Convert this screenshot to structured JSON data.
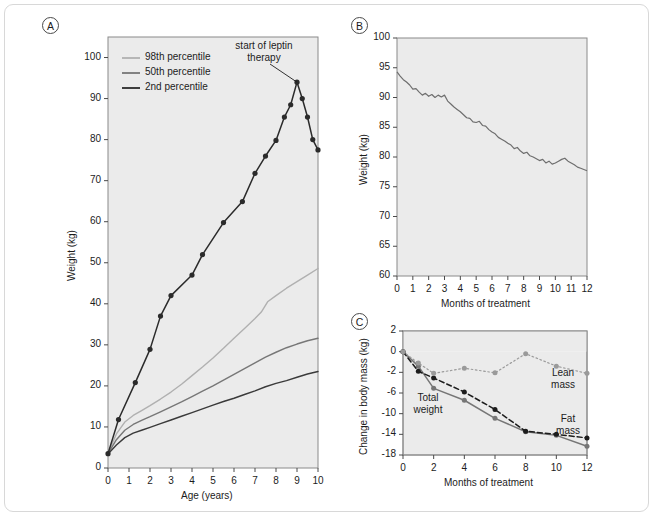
{
  "figure": {
    "panels": [
      "A",
      "B",
      "C"
    ]
  },
  "panelA": {
    "letter": "A",
    "xlabel": "Age (years)",
    "ylabel": "Weight (kg)",
    "yticks": [
      0,
      10,
      20,
      30,
      40,
      50,
      60,
      70,
      80,
      90,
      100
    ],
    "xticks": [
      0,
      1,
      2,
      3,
      4,
      5,
      6,
      7,
      8,
      9,
      10
    ],
    "legend": [
      {
        "label": "98th percentile",
        "color": "#b0b0b0"
      },
      {
        "label": "50th percentile",
        "color": "#777777"
      },
      {
        "label": "2nd percentile",
        "color": "#2b2b2b"
      }
    ],
    "annotation": {
      "line1": "start of leptin",
      "line2": "therapy"
    }
  },
  "panelB": {
    "letter": "B",
    "xlabel": "Months of treatment",
    "ylabel": "Weight (kg)",
    "yticks": [
      60,
      65,
      70,
      75,
      80,
      85,
      90,
      95,
      100
    ],
    "xticks": [
      0,
      1,
      2,
      3,
      4,
      5,
      6,
      7,
      8,
      9,
      10,
      11,
      12
    ]
  },
  "panelC": {
    "letter": "C",
    "xlabel": "Months of treatment",
    "ylabel": "Change in body mass (kg)",
    "yticks": [
      2,
      0,
      -2,
      -6,
      -10,
      -14,
      -18
    ],
    "xticks": [
      0,
      2,
      4,
      6,
      8,
      10,
      12
    ],
    "labels": {
      "total": {
        "line1": "Total",
        "line2": "weight"
      },
      "lean": {
        "line1": "Lean",
        "line2": "mass"
      },
      "fat": {
        "line1": "Fat",
        "line2": "mass"
      }
    }
  },
  "chart_data": [
    {
      "type": "line",
      "panel": "A",
      "title": "",
      "xlabel": "Age (years)",
      "ylabel": "Weight (kg)",
      "xlim": [
        0,
        10
      ],
      "ylim": [
        0,
        105
      ],
      "grid": false,
      "legend_position": "top-left",
      "annotations": [
        {
          "text": "start of leptin therapy",
          "x": 9.0,
          "y": 94.0
        }
      ],
      "series": [
        {
          "name": "patient",
          "color": "#2b2b2b",
          "markers": true,
          "x": [
            0,
            0.5,
            1.3,
            2.0,
            2.5,
            3.0,
            4.0,
            4.5,
            5.5,
            6.4,
            7.0,
            7.5,
            8.0,
            8.4,
            8.7,
            9.0,
            9.25,
            9.5,
            9.75,
            10.0
          ],
          "y": [
            3.5,
            11.8,
            20.8,
            28.9,
            37.0,
            42.0,
            47.0,
            52.0,
            59.8,
            64.9,
            71.8,
            76.0,
            79.8,
            85.5,
            88.5,
            94.0,
            90.0,
            85.5,
            80.0,
            77.5
          ]
        },
        {
          "name": "98th percentile",
          "color": "#b0b0b0",
          "markers": false,
          "x": [
            0,
            0.4,
            0.8,
            1.2,
            1.6,
            2.0,
            2.5,
            3.0,
            3.5,
            4.0,
            4.5,
            5.0,
            5.5,
            6.0,
            6.5,
            7.0,
            7.3,
            7.6,
            8.0,
            8.5,
            9.0,
            9.5,
            10.0
          ],
          "y": [
            3.6,
            8.3,
            11.2,
            12.8,
            14.0,
            15.2,
            16.8,
            18.5,
            20.4,
            22.5,
            24.6,
            26.8,
            29.2,
            31.6,
            34.0,
            36.4,
            38.0,
            40.5,
            42.0,
            43.8,
            45.4,
            47.0,
            48.6
          ]
        },
        {
          "name": "50th percentile",
          "color": "#777777",
          "markers": false,
          "x": [
            0,
            0.4,
            0.8,
            1.2,
            1.6,
            2.0,
            2.5,
            3.0,
            3.5,
            4.0,
            4.5,
            5.0,
            5.5,
            6.0,
            6.5,
            7.0,
            7.5,
            8.0,
            8.5,
            9.0,
            9.5,
            10.0
          ],
          "y": [
            3.5,
            6.9,
            9.2,
            10.6,
            11.6,
            12.5,
            13.7,
            14.9,
            16.1,
            17.4,
            18.7,
            20.0,
            21.4,
            22.8,
            24.2,
            25.6,
            27.0,
            28.2,
            29.3,
            30.2,
            31.0,
            31.6
          ]
        },
        {
          "name": "2nd percentile",
          "color": "#3a3a3a",
          "markers": false,
          "x": [
            0,
            0.4,
            0.8,
            1.2,
            1.6,
            2.0,
            2.5,
            3.0,
            3.5,
            4.0,
            4.5,
            5.0,
            5.5,
            6.0,
            6.5,
            7.0,
            7.5,
            8.0,
            8.5,
            9.0,
            9.5,
            10.0
          ],
          "y": [
            3.4,
            5.6,
            7.4,
            8.5,
            9.2,
            9.9,
            10.8,
            11.7,
            12.6,
            13.5,
            14.4,
            15.3,
            16.2,
            17.0,
            17.9,
            18.8,
            19.8,
            20.6,
            21.3,
            22.1,
            22.9,
            23.5
          ]
        }
      ]
    },
    {
      "type": "line",
      "panel": "B",
      "title": "",
      "xlabel": "Months of treatment",
      "ylabel": "Weight (kg)",
      "xlim": [
        0,
        12
      ],
      "ylim": [
        60,
        100
      ],
      "grid": false,
      "series": [
        {
          "name": "weight",
          "color": "#6e6e6e",
          "markers": false,
          "x": [
            0,
            0.2,
            0.4,
            0.6,
            0.8,
            1.0,
            1.2,
            1.4,
            1.6,
            1.8,
            2.0,
            2.2,
            2.4,
            2.6,
            2.8,
            3.0,
            3.2,
            3.4,
            3.6,
            3.8,
            4.0,
            4.2,
            4.4,
            4.6,
            4.8,
            5.0,
            5.2,
            5.4,
            5.6,
            5.8,
            6.0,
            6.2,
            6.4,
            6.6,
            6.8,
            7.0,
            7.2,
            7.4,
            7.6,
            7.8,
            8.0,
            8.2,
            8.4,
            8.6,
            8.8,
            9.0,
            9.2,
            9.4,
            9.6,
            9.8,
            10.0,
            10.2,
            10.4,
            10.6,
            10.8,
            11.0,
            11.2,
            11.4,
            11.6,
            11.8,
            12.0
          ],
          "y": [
            94.3,
            93.6,
            93.0,
            92.6,
            92.1,
            91.4,
            91.5,
            90.9,
            90.4,
            90.7,
            90.2,
            90.5,
            90.0,
            90.4,
            90.1,
            90.4,
            89.4,
            88.9,
            88.4,
            88.0,
            87.6,
            87.1,
            86.6,
            86.5,
            85.9,
            85.8,
            86.0,
            85.3,
            85.2,
            84.6,
            84.2,
            83.9,
            83.3,
            83.0,
            82.7,
            82.3,
            82.0,
            81.4,
            81.6,
            81.0,
            80.6,
            80.8,
            80.2,
            80.0,
            79.7,
            79.4,
            79.6,
            79.0,
            79.3,
            78.8,
            79.0,
            79.3,
            79.6,
            79.8,
            79.3,
            79.0,
            78.7,
            78.3,
            78.1,
            77.9,
            77.7
          ]
        }
      ]
    },
    {
      "type": "line",
      "panel": "C",
      "title": "",
      "xlabel": "Months of treatment",
      "ylabel": "Change in body mass (kg)",
      "xlim": [
        0,
        12
      ],
      "ylim": [
        -18,
        2
      ],
      "grid": false,
      "series": [
        {
          "name": "Total weight",
          "color": "#767676",
          "style": "solid",
          "markers": true,
          "x": [
            0,
            1,
            2,
            4,
            6,
            8,
            10,
            12
          ],
          "y": [
            0,
            -1.4,
            -5.1,
            -7.4,
            -10.9,
            -13.5,
            -14.2,
            -16.3
          ]
        },
        {
          "name": "Fat mass",
          "color": "#1c1c1c",
          "style": "dashed",
          "markers": true,
          "x": [
            0,
            1,
            2,
            4,
            6,
            8,
            10,
            12
          ],
          "y": [
            0,
            -1.9,
            -3.1,
            -5.8,
            -9.2,
            -13.4,
            -14.0,
            -14.7
          ]
        },
        {
          "name": "Lean mass",
          "color": "#9a9a9a",
          "style": "dotted",
          "markers": true,
          "x": [
            0,
            1,
            2,
            4,
            6,
            8,
            10,
            12
          ],
          "y": [
            0,
            -1.1,
            -2.2,
            -1.6,
            -2.1,
            -0.2,
            -1.4,
            -2.2
          ]
        }
      ]
    }
  ]
}
